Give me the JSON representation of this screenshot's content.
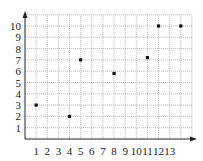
{
  "chart_data": {
    "type": "scatter",
    "title": "",
    "xlabel": "",
    "ylabel": "",
    "x_tick_labels": [
      "1",
      "2",
      "3",
      "4",
      "5",
      "6",
      "7",
      "8",
      "9",
      "10",
      "11",
      "12",
      "13"
    ],
    "y_tick_labels": [
      "1",
      "2",
      "3",
      "4",
      "5",
      "6",
      "7",
      "8",
      "9",
      "10"
    ],
    "xlim": [
      0,
      15
    ],
    "ylim": [
      0,
      11
    ],
    "grid": true,
    "legend": null,
    "points": [
      {
        "x": 1,
        "y": 3
      },
      {
        "x": 4,
        "y": 2
      },
      {
        "x": 5,
        "y": 7
      },
      {
        "x": 8,
        "y": 5.8
      },
      {
        "x": 11,
        "y": 7.2
      },
      {
        "x": 12,
        "y": 10
      },
      {
        "x": 14,
        "y": 10
      }
    ]
  },
  "colors": {
    "point": "#111111",
    "axis": "#222222",
    "grid": "#9a9a9a"
  }
}
